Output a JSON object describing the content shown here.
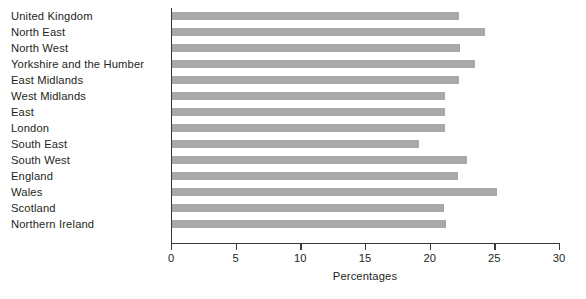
{
  "chart_data": {
    "type": "bar",
    "orientation": "horizontal",
    "title": "",
    "subtitle": "",
    "xlabel": "Percentages",
    "ylabel": "",
    "xlim": [
      0,
      30
    ],
    "ylim": null,
    "xticks": [
      0,
      5,
      10,
      15,
      20,
      25,
      30
    ],
    "xticklabels": [
      "0",
      "5",
      "10",
      "15",
      "20",
      "25",
      "30"
    ],
    "grid": false,
    "legend": null,
    "bar_color": "#a8a8a8",
    "axis_color": "#3a3a3a",
    "categories": [
      "United Kingdom",
      "North East",
      "North West",
      "Yorkshire and the Humber",
      "East Midlands",
      "West Midlands",
      "East",
      "London",
      "South East",
      "South West",
      "England",
      "Wales",
      "Scotland",
      "Northern Ireland"
    ],
    "values": [
      22.2,
      24.2,
      22.3,
      23.4,
      22.2,
      21.1,
      21.1,
      21.1,
      19.1,
      22.8,
      22.1,
      25.1,
      21.0,
      21.2
    ]
  }
}
